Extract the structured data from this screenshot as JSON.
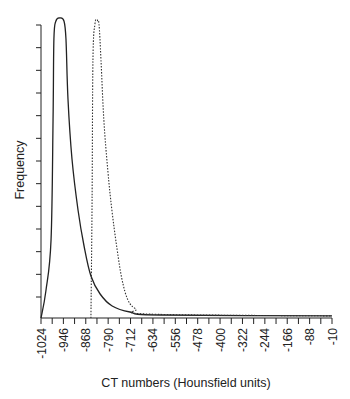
{
  "chart_data": {
    "type": "line",
    "title": "",
    "xlabel": "CT numbers (Hounsfield units)",
    "ylabel": "Frequency",
    "xlim": [
      -1024,
      -10
    ],
    "ylim": [
      0,
      100
    ],
    "x_ticks": [
      -1024,
      -946,
      -868,
      -790,
      -712,
      -634,
      -556,
      -478,
      -400,
      -322,
      -244,
      -166,
      -88,
      -10
    ],
    "y_tick_count": 13,
    "y_tick_labels": [],
    "grid": false,
    "legend": null,
    "series": [
      {
        "name": "solid",
        "style": "solid",
        "x": [
          -1024,
          -1007,
          -989,
          -982,
          -979,
          -972,
          -958,
          -944,
          -937,
          -930,
          -916,
          -895,
          -874,
          -850,
          -818,
          -776,
          -714,
          -609,
          -10
        ],
        "y": [
          0,
          9,
          26,
          66,
          93,
          99,
          100,
          99,
          93,
          73,
          53,
          36,
          24,
          14,
          8,
          4,
          2,
          1,
          0.7
        ]
      },
      {
        "name": "dashed",
        "style": "dotted",
        "x": [
          -850,
          -846,
          -843,
          -836,
          -829,
          -822,
          -815,
          -805,
          -791,
          -777,
          -759,
          -742,
          -721,
          -693,
          -644,
          -10
        ],
        "y": [
          0,
          39,
          86,
          98,
          99,
          98,
          86,
          66,
          49,
          36,
          23,
          13,
          6,
          3,
          1.3,
          0.7
        ]
      }
    ]
  },
  "labels": {
    "x_axis": "CT numbers (Hounsfield units)",
    "y_axis": "Frequency",
    "x_ticks": [
      "-1024",
      "-946",
      "-868",
      "-790",
      "-712",
      "-634",
      "-556",
      "-478",
      "-400",
      "-322",
      "-244",
      "-166",
      "-88",
      "-10"
    ]
  }
}
